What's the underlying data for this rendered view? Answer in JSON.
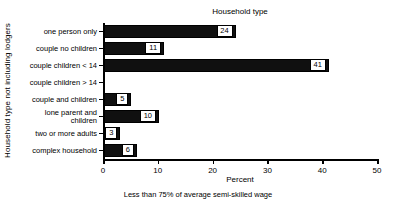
{
  "chart_data": {
    "type": "bar",
    "orientation": "horizontal",
    "title": "Household type",
    "xlabel": "Percent",
    "ylabel": "Household type not including lodgers",
    "caption": "Less than 75% of average semi-skilled wage",
    "categories": [
      "one person only",
      "couple no children",
      "couple children < 14",
      "couple children > 14",
      "couple and children",
      "lone parent and children",
      "two or more adults",
      "complex household"
    ],
    "values": [
      24,
      11,
      41,
      0,
      5,
      10,
      3,
      6
    ],
    "value_labels": [
      "24",
      "11",
      "41",
      "",
      "5",
      "10",
      "3",
      "6"
    ],
    "xlim": [
      0,
      50
    ],
    "xticks": [
      0,
      10,
      20,
      30,
      40,
      50
    ],
    "xtick_labels": [
      "0",
      "10",
      "20",
      "30",
      "40",
      "50"
    ],
    "grid": false,
    "legend": false,
    "bar_color": "#101010",
    "axis_color": "#000000",
    "background": "#ffffff"
  }
}
